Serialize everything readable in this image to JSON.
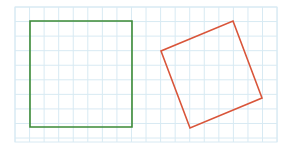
{
  "canvas": {
    "width": 287,
    "height": 151,
    "background": "#ffffff"
  },
  "grid": {
    "x": 15,
    "y": 7,
    "width": 262,
    "height": 135,
    "cell": 14.56,
    "color": "#d8eaf3"
  },
  "shapes": [
    {
      "name": "green-square",
      "type": "square",
      "color": "#3b8a36",
      "stroke_width": 1.6,
      "points": [
        [
          30,
          21
        ],
        [
          132,
          21
        ],
        [
          132,
          127
        ],
        [
          30,
          127
        ]
      ]
    },
    {
      "name": "red-rotated-square",
      "type": "square",
      "color": "#d9553a",
      "stroke_width": 1.6,
      "points": [
        [
          233,
          21
        ],
        [
          262,
          98
        ],
        [
          190,
          128
        ],
        [
          161,
          51
        ]
      ]
    }
  ]
}
